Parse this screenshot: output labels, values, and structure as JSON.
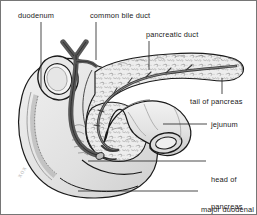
{
  "figure": {
    "type": "anatomical-illustration",
    "background_color": "#ffffff",
    "border_color": "#6e6e6e",
    "watermark_text": "xox"
  },
  "labels": [
    {
      "id": "duodenum",
      "text": "duodenum",
      "x": 18,
      "y": 11,
      "leader": {
        "type": "vertical",
        "x": 41,
        "y1": 22,
        "y2": 88
      }
    },
    {
      "id": "common-bile-duct",
      "text": "common bile duct",
      "x": 90,
      "y": 11,
      "leader": {
        "type": "vertical",
        "x": 96,
        "y1": 22,
        "y2": 60
      }
    },
    {
      "id": "pancreatic-duct",
      "text": "pancreatic duct",
      "x": 146,
      "y": 30,
      "leader": {
        "type": "vertical",
        "x": 149,
        "y1": 41,
        "y2": 70
      }
    },
    {
      "id": "tail-of-pancreas",
      "text": "tail of pancreas",
      "x": 190,
      "y": 97,
      "leader": {
        "type": "vertical",
        "x": 222,
        "y1": 78,
        "y2": 95
      }
    },
    {
      "id": "jejunum",
      "text": "jejunum",
      "x": 211,
      "y": 120,
      "leader": {
        "type": "horizontal",
        "y": 124,
        "x1": 163,
        "x2": 207
      }
    },
    {
      "id": "head-of-pancreas",
      "text": "head of\npancreas",
      "line1": "head of",
      "line2": "pancreas",
      "x": 211,
      "y": 157,
      "leader": {
        "type": "horizontal",
        "y": 161,
        "x1": 88,
        "x2": 206
      }
    },
    {
      "id": "major-duodenal-papilla",
      "text": "major duodenal\npapilla",
      "line1": "major duodenal",
      "line2": "papilla",
      "x": 201,
      "y": 187,
      "leader": {
        "type": "horizontal",
        "y": 191,
        "x1": 78,
        "x2": 198
      }
    }
  ],
  "structures": [
    {
      "id": "duodenum",
      "label": "duodenum",
      "fill": "#e2e2e2",
      "stroke": "#1a1a1a"
    },
    {
      "id": "common-bile-duct",
      "label": "common bile duct",
      "fill": "#6b6b6b",
      "stroke": "#111111"
    },
    {
      "id": "pancreas-body",
      "label": "body of pancreas",
      "fill": "#efefef",
      "stroke": "#1a1a1a"
    },
    {
      "id": "pancreatic-duct",
      "label": "pancreatic duct",
      "fill": "#555555",
      "stroke": "#111111"
    },
    {
      "id": "jejunum",
      "label": "jejunum",
      "fill": "#e8e8e8",
      "stroke": "#1a1a1a"
    },
    {
      "id": "tail-of-pancreas",
      "label": "tail of pancreas",
      "fill": "#efefef",
      "stroke": "#1a1a1a"
    },
    {
      "id": "major-duodenal-papilla",
      "label": "major duodenal papilla",
      "fill": "#d8d8d8",
      "stroke": "#1a1a1a"
    }
  ],
  "colors": {
    "line": "#1a1a1a",
    "leader": "#2b2b2b",
    "duct_dark": "#6b6b6b",
    "duct_darker": "#4a4a4a",
    "tissue_light": "#ededed",
    "tissue_mid": "#dcdcdc",
    "tissue_shadow": "#c4c4c4",
    "text": "#1a1a1a"
  }
}
